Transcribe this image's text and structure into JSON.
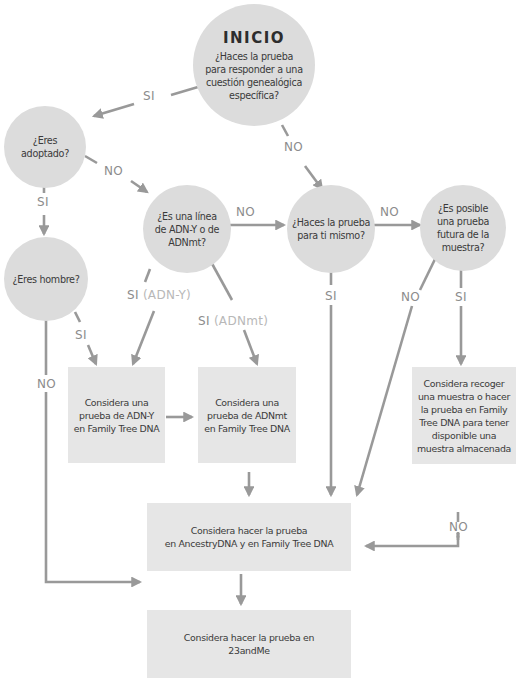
{
  "colors": {
    "node_fill": "#dcdcdc",
    "box_fill": "#e6e6e6",
    "arrow": "#999999",
    "label": "#8c8c8c",
    "label_light": "#b8b8b8",
    "text": "#3a3a3a"
  },
  "nodes": {
    "start": {
      "title": "INICIO",
      "text": "¿Haces la prueba\npara responder a una\ncuestión genealógica\nespecífica?"
    },
    "adopted": {
      "text": "¿Eres\nadoptado?"
    },
    "lineage": {
      "text": "¿Es una línea\nde ADN-Y o de\nADNmt?"
    },
    "self": {
      "text": "¿Haces la prueba\npara ti mismo?"
    },
    "future": {
      "text": "¿Es posible\nuna prueba\nfutura de la\nmuestra?"
    },
    "male": {
      "text": "¿Eres hombre?"
    },
    "ydna": {
      "text": "Considera una\nprueba de ADN-Y\nen Family Tree DNA"
    },
    "mtdna": {
      "text": "Considera una\nprueba de ADNmt\nen Family Tree DNA"
    },
    "store": {
      "text": "Considera recoger\nuna muestra o hacer\nla prueba en Family\nTree DNA para tener\ndisponible una\nmuestra almacenada"
    },
    "ancestry": {
      "text": "Considera hacer la prueba\nen AncestryDNA y en Family Tree DNA"
    },
    "23andme": {
      "text": "Considera hacer la prueba en\n23andMe"
    }
  },
  "labels": {
    "start_si": "SI",
    "start_no": "NO",
    "adopted_no": "NO",
    "adopted_si": "SI",
    "lineage_no": "NO",
    "self_no": "NO",
    "lineage_si_y": "SI",
    "lineage_si_y_sub": "(ADN-Y)",
    "lineage_si_mt": "SI",
    "lineage_si_mt_sub": "(ADNmt)",
    "male_si": "SI",
    "male_no": "NO",
    "self_si": "SI",
    "future_no": "NO",
    "future_si": "SI",
    "store_no": "NO"
  }
}
